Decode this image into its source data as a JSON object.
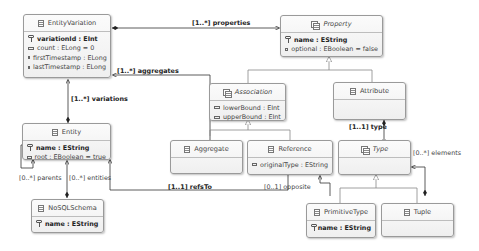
{
  "classes": {
    "entity_variation": {
      "name": "EntityVariation",
      "attrs": [
        "variationId : EInt",
        "count : ELong = 0",
        "firstTimestamp : ELong",
        "lastTimestamp : ELong"
      ]
    },
    "property": {
      "name": "Property",
      "attrs": [
        "name : EString",
        "optional : EBoolean = false"
      ]
    },
    "association": {
      "name": "Association",
      "attrs": [
        "lowerBound : EInt",
        "upperBound : EInt"
      ]
    },
    "attribute": {
      "name": "Attribute"
    },
    "entity": {
      "name": "Entity",
      "attrs": [
        "name : EString",
        "root : EBoolean = true"
      ]
    },
    "aggregate": {
      "name": "Aggregate"
    },
    "reference": {
      "name": "Reference",
      "attrs": [
        "originalType : EString"
      ]
    },
    "type": {
      "name": "Type"
    },
    "nosql_schema": {
      "name": "NoSQLSchema",
      "attrs": [
        "name : EString"
      ]
    },
    "primitive_type": {
      "name": "PrimitiveType",
      "attrs": [
        "name : EString"
      ]
    },
    "tuple": {
      "name": "Tuple"
    }
  },
  "relations": {
    "properties": "[1..*] properties",
    "aggregates": "[1..*] aggregates",
    "variations": "[1..*] variations",
    "parents": "[0..*] parents",
    "entities": "[0..*] entities",
    "refs_to": "[1..1] refsTo",
    "type": "[1..1] type",
    "elements": "[0..*] elements",
    "opposite": "[0..1] opposite"
  }
}
